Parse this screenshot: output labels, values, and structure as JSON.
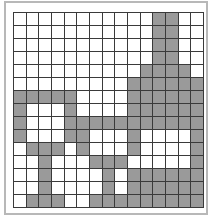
{
  "grid": {
    "rows": 15,
    "cols": 15,
    "fill_color": "#9a9a9a",
    "empty_color": "#ffffff",
    "line_color": "#3a3a3a",
    "cells": [
      [
        0,
        0,
        0,
        0,
        0,
        0,
        0,
        0,
        0,
        0,
        0,
        1,
        1,
        0,
        0
      ],
      [
        0,
        0,
        0,
        0,
        0,
        0,
        0,
        0,
        0,
        0,
        0,
        1,
        1,
        0,
        0
      ],
      [
        0,
        0,
        0,
        0,
        0,
        0,
        0,
        0,
        0,
        0,
        0,
        1,
        1,
        0,
        0
      ],
      [
        0,
        0,
        0,
        0,
        0,
        0,
        0,
        0,
        0,
        0,
        0,
        1,
        1,
        0,
        0
      ],
      [
        0,
        0,
        0,
        0,
        0,
        0,
        0,
        0,
        0,
        0,
        1,
        1,
        1,
        1,
        0
      ],
      [
        0,
        0,
        0,
        0,
        0,
        0,
        0,
        0,
        0,
        1,
        1,
        1,
        1,
        1,
        1
      ],
      [
        1,
        1,
        1,
        1,
        1,
        0,
        0,
        0,
        0,
        1,
        1,
        1,
        1,
        1,
        1
      ],
      [
        1,
        0,
        0,
        0,
        1,
        0,
        0,
        0,
        0,
        1,
        1,
        1,
        1,
        1,
        1
      ],
      [
        1,
        0,
        0,
        0,
        1,
        1,
        1,
        1,
        1,
        1,
        1,
        1,
        1,
        1,
        1
      ],
      [
        1,
        0,
        0,
        0,
        1,
        1,
        0,
        0,
        0,
        1,
        0,
        0,
        0,
        0,
        1
      ],
      [
        0,
        1,
        1,
        1,
        0,
        1,
        0,
        0,
        0,
        1,
        0,
        0,
        0,
        0,
        1
      ],
      [
        0,
        0,
        1,
        0,
        0,
        0,
        1,
        1,
        1,
        0,
        0,
        0,
        0,
        0,
        1
      ],
      [
        0,
        0,
        1,
        0,
        0,
        0,
        0,
        1,
        0,
        1,
        1,
        1,
        1,
        1,
        1
      ],
      [
        0,
        0,
        1,
        0,
        0,
        0,
        0,
        1,
        0,
        1,
        1,
        1,
        1,
        1,
        1
      ],
      [
        0,
        1,
        1,
        1,
        0,
        0,
        1,
        1,
        1,
        1,
        1,
        1,
        1,
        1,
        1
      ]
    ]
  }
}
